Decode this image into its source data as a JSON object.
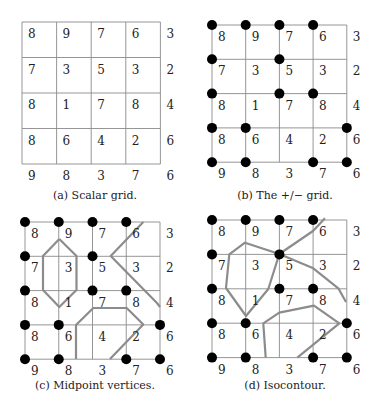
{
  "figure": {
    "values": [
      [
        8,
        9,
        7,
        6,
        3
      ],
      [
        7,
        3,
        5,
        3,
        2
      ],
      [
        8,
        1,
        7,
        8,
        4
      ],
      [
        8,
        6,
        4,
        2,
        6
      ],
      [
        9,
        8,
        3,
        7,
        6
      ]
    ],
    "threshold_note": "Filled dots mark grid vertices with value >= 5",
    "colors": {
      "grid": "#8a8a8a",
      "contour": "#8c8c8c",
      "dot": "#000000",
      "text": "#222222"
    },
    "panels": [
      {
        "id": "a",
        "caption": "(a) Scalar grid.",
        "origin": [
          22,
          22
        ],
        "cell": [
          34.6,
          35.5
        ],
        "show_dots": false,
        "contours": []
      },
      {
        "id": "b",
        "caption": "(b) The +/− grid.",
        "origin": [
          212,
          25
        ],
        "cell": [
          33.7,
          34.3
        ],
        "show_dots": true,
        "contours": []
      },
      {
        "id": "c",
        "caption": "(c) Midpoint vertices.",
        "origin": [
          25,
          222
        ],
        "cell": [
          33.75,
          34.3
        ],
        "show_dots": true,
        "contours": [
          [
            [
              59.3,
              239
            ],
            [
              43,
              256
            ],
            [
              43,
              290
            ],
            [
              59.3,
              307
            ],
            [
              76.5,
              290
            ],
            [
              76.5,
              256
            ],
            [
              59.3,
              239
            ]
          ],
          [
            [
              143.3,
              222
            ],
            [
              110.7,
              256
            ],
            [
              157,
              303
            ],
            [
              160,
              307
            ]
          ],
          [
            [
              76,
              359
            ],
            [
              76,
              325
            ],
            [
              93.3,
              308
            ],
            [
              126.7,
              308
            ],
            [
              143.3,
              324.5
            ],
            [
              110,
              359
            ]
          ]
        ]
      },
      {
        "id": "d",
        "caption": "(d) Isocontour.",
        "origin": [
          212,
          220
        ],
        "cell": [
          33.7,
          34.4
        ],
        "show_dots": true,
        "contours": [
          [
            [
              279.3,
              254
            ],
            [
              268.3,
              289
            ],
            [
              246,
              316
            ],
            [
              226,
              288
            ],
            [
              229.3,
              254.3
            ],
            [
              245,
              242.7
            ],
            [
              279.3,
              254
            ]
          ],
          [
            [
              325,
              218.3
            ],
            [
              313,
              231
            ],
            [
              279.3,
              254
            ],
            [
              313.3,
              268.3
            ],
            [
              338.3,
              288.3
            ],
            [
              346,
              302
            ]
          ],
          [
            [
              265.7,
              357.7
            ],
            [
              263.3,
              323.3
            ],
            [
              279.3,
              312.7
            ],
            [
              314,
              305.7
            ],
            [
              339.3,
              323.3
            ],
            [
              297.3,
              357.7
            ]
          ]
        ]
      }
    ]
  }
}
